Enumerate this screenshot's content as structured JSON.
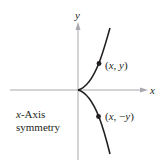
{
  "diagram": {
    "axes": {
      "x_label": "x",
      "y_label": "y"
    },
    "points": [
      {
        "label": "(x, y)",
        "parts": [
          "(",
          "x",
          ", ",
          "y",
          ")"
        ]
      },
      {
        "label": "(x, −y)",
        "parts": [
          "(",
          "x",
          ", −",
          "y",
          ")"
        ]
      }
    ],
    "caption": {
      "line1_var": "x",
      "line1_rest": "-Axis",
      "line2": "symmetry"
    },
    "colors": {
      "axis": "#a7a9ac",
      "curve": "#231f20",
      "text": "#231f20"
    }
  }
}
